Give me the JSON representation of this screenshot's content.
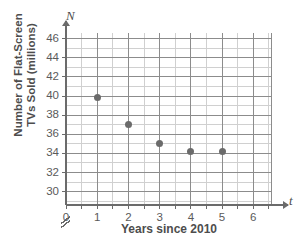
{
  "chart_data": {
    "type": "scatter",
    "title": "",
    "xlabel": "Years since 2010",
    "ylabel_line1": "Number of Flat-Screen",
    "ylabel_line2": "TVs Sold (millions)",
    "x_axis_symbol": "t",
    "y_axis_symbol": "N",
    "x": [
      1,
      2,
      3,
      4,
      5
    ],
    "values": [
      39.8,
      37,
      35,
      34.2,
      34.2
    ],
    "points": [
      {
        "x": 1,
        "y": 39.8
      },
      {
        "x": 2,
        "y": 37
      },
      {
        "x": 3,
        "y": 35
      },
      {
        "x": 4,
        "y": 34.2
      },
      {
        "x": 5,
        "y": 34.2
      }
    ],
    "xlim": [
      0,
      6.6
    ],
    "ylim": [
      28.6,
      46.6
    ],
    "x_ticks": [
      0,
      1,
      2,
      3,
      4,
      5,
      6
    ],
    "x_tick_labels": [
      "0",
      "1",
      "2",
      "3",
      "4",
      "5",
      "6"
    ],
    "x_minor_step": 0.5,
    "y_ticks": [
      30,
      32,
      34,
      36,
      38,
      40,
      42,
      44,
      46
    ],
    "y_tick_labels": [
      "30",
      "32",
      "34",
      "36",
      "38",
      "40",
      "42",
      "44",
      "46"
    ],
    "y_minor_step": 1,
    "grid": true,
    "legend": null,
    "axis_break": {
      "axis": "y",
      "symbol": "⫻",
      "below_value": 30
    },
    "colors": {
      "point": "#6b6b6b",
      "grid_major": "#8c8c8c",
      "grid_minor": "#d0d0d0",
      "axis": "#6b6b6b",
      "text": "#4d4d4d",
      "background": "#ffffff"
    }
  },
  "artifact": {
    "top_text": ""
  }
}
